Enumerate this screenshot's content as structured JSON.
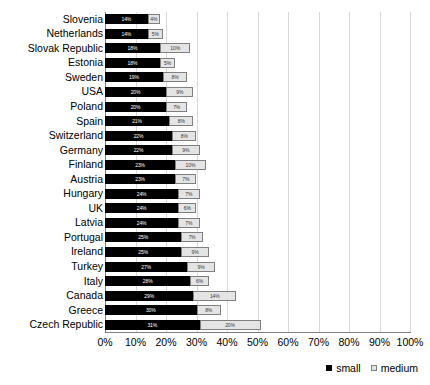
{
  "chart_data": {
    "type": "bar",
    "orientation": "horizontal",
    "stacked": true,
    "title": "",
    "xlabel": "",
    "ylabel": "",
    "xlim": [
      0,
      100
    ],
    "xtick_labels": [
      "0%",
      "10%",
      "20%",
      "30%",
      "40%",
      "50%",
      "60%",
      "70%",
      "80%",
      "90%",
      "100%"
    ],
    "xtick_values": [
      0,
      10,
      20,
      30,
      40,
      50,
      60,
      70,
      80,
      90,
      100
    ],
    "grid": true,
    "legend_position": "bottom-right",
    "categories": [
      "Slovenia",
      "Netherlands",
      "Slovak Republic",
      "Estonia",
      "Sweden",
      "USA",
      "Poland",
      "Spain",
      "Switzerland",
      "Germany",
      "Finland",
      "Austria",
      "Hungary",
      "UK",
      "Latvia",
      "Portugal",
      "Ireland",
      "Turkey",
      "Italy",
      "Canada",
      "Greece",
      "Czech Republic"
    ],
    "series": [
      {
        "name": "small",
        "color": "#000000",
        "values": [
          14,
          14,
          18,
          18,
          19,
          20,
          20,
          21,
          22,
          22,
          23,
          23,
          24,
          24,
          24,
          25,
          25,
          27,
          28,
          29,
          30,
          31
        ],
        "labels": [
          "14%",
          "14%",
          "18%",
          "18%",
          "19%",
          "20%",
          "20%",
          "21%",
          "22%",
          "22%",
          "23%",
          "23%",
          "24%",
          "24%",
          "24%",
          "25%",
          "25%",
          "27%",
          "28%",
          "29%",
          "30%",
          "31%"
        ]
      },
      {
        "name": "medium",
        "color": "#e4e4e4",
        "values": [
          4,
          5,
          10,
          5,
          8,
          9,
          7,
          8,
          8,
          9,
          10,
          7,
          7,
          6,
          7,
          7,
          9,
          9,
          6,
          14,
          8,
          20
        ],
        "labels": [
          "4%",
          "5%",
          "10%",
          "5%",
          "8%",
          "9%",
          "7%",
          "8%",
          "8%",
          "9%",
          "10%",
          "7%",
          "7%",
          "6%",
          "7%",
          "7%",
          "9%",
          "9%",
          "6%",
          "14%",
          "8%",
          "20%"
        ]
      }
    ],
    "legend": [
      {
        "label": "small",
        "color": "#000000"
      },
      {
        "label": "medium",
        "color": "#e4e4e4"
      }
    ]
  }
}
